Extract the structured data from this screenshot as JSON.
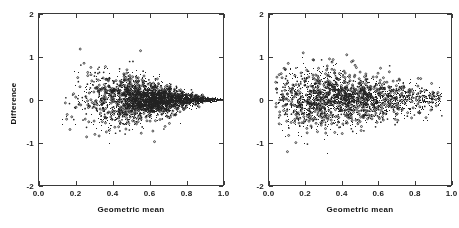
{
  "figure": {
    "panels": [
      {
        "id": "left-panel",
        "name": "left-scatter-panel",
        "xlabel": "Geometric mean",
        "ylabel": "Difference",
        "xticks": [
          "0.0",
          "0.2",
          "0.4",
          "0.6",
          "0.8",
          "1.0"
        ],
        "xtick_values": [
          0.0,
          0.2,
          0.4,
          0.6,
          0.8,
          1.0
        ],
        "yticks": [
          "2",
          "1",
          "0",
          "-1",
          "-2"
        ],
        "ytick_values": [
          2,
          1,
          0,
          -1,
          -2
        ]
      },
      {
        "id": "right-panel",
        "name": "right-scatter-panel",
        "xlabel": "Geometric mean",
        "ylabel": "",
        "xticks": [
          "0.0",
          "0.2",
          "0.4",
          "0.6",
          "0.8",
          "1.0"
        ],
        "xtick_values": [
          0.0,
          0.2,
          0.4,
          0.6,
          0.8,
          1.0
        ],
        "yticks": [
          "2",
          "1",
          "0",
          "-1",
          "-2"
        ],
        "ytick_values": [
          2,
          1,
          0,
          -1,
          -2
        ]
      }
    ]
  },
  "chart_data": [
    {
      "type": "scatter",
      "title": "",
      "xlabel": "Geometric mean",
      "ylabel": "Difference",
      "xlim": [
        0.0,
        1.0
      ],
      "ylim": [
        -2,
        2
      ],
      "xticks": [
        0.0,
        0.2,
        0.4,
        0.6,
        0.8,
        1.0
      ],
      "yticks": [
        -2,
        -1,
        0,
        1,
        2
      ],
      "grid": false,
      "legend": false,
      "marker": "open-circle",
      "marker_size_px": 2,
      "color": "#222222",
      "n_points": 2200,
      "description": "Funnel-shaped Bland-Altman plot: scatter centered on Difference = 0 with spread that shrinks steadily as Geometric mean increases from 0.0 to 1.0, converging to near zero at 1.0.",
      "spread_model": {
        "center": 0.0,
        "sd_at_x": [
          {
            "x": 0.05,
            "sd": 0.62
          },
          {
            "x": 0.1,
            "sd": 0.55
          },
          {
            "x": 0.2,
            "sd": 0.46
          },
          {
            "x": 0.3,
            "sd": 0.38
          },
          {
            "x": 0.4,
            "sd": 0.31
          },
          {
            "x": 0.5,
            "sd": 0.26
          },
          {
            "x": 0.6,
            "sd": 0.21
          },
          {
            "x": 0.7,
            "sd": 0.16
          },
          {
            "x": 0.8,
            "sd": 0.11
          },
          {
            "x": 0.9,
            "sd": 0.06
          },
          {
            "x": 1.0,
            "sd": 0.02
          }
        ],
        "x_density_peak": 0.62
      },
      "extremes": {
        "min_y": -1.8,
        "max_y": 1.5
      }
    },
    {
      "type": "scatter",
      "title": "",
      "xlabel": "Geometric mean",
      "ylabel": "",
      "xlim": [
        0.0,
        1.0
      ],
      "ylim": [
        -2,
        2
      ],
      "xticks": [
        0.0,
        0.2,
        0.4,
        0.6,
        0.8,
        1.0
      ],
      "yticks": [
        -2,
        -1,
        0,
        1,
        2
      ],
      "grid": false,
      "legend": false,
      "marker": "open-circle",
      "marker_size_px": 2,
      "color": "#222222",
      "n_points": 1700,
      "description": "Bland-Altman plot with an approximately uniform horizontal band centered slightly above Difference = 0, spread only mildly narrowing toward Geometric mean = 1.0; denser cloud between 0.1 and 0.5.",
      "spread_model": {
        "center": 0.02,
        "sd_at_x": [
          {
            "x": 0.05,
            "sd": 0.42
          },
          {
            "x": 0.1,
            "sd": 0.4
          },
          {
            "x": 0.2,
            "sd": 0.38
          },
          {
            "x": 0.3,
            "sd": 0.35
          },
          {
            "x": 0.4,
            "sd": 0.33
          },
          {
            "x": 0.5,
            "sd": 0.3
          },
          {
            "x": 0.6,
            "sd": 0.28
          },
          {
            "x": 0.7,
            "sd": 0.25
          },
          {
            "x": 0.8,
            "sd": 0.23
          },
          {
            "x": 0.9,
            "sd": 0.2
          },
          {
            "x": 1.0,
            "sd": 0.17
          }
        ],
        "x_density_peak": 0.33
      },
      "extremes": {
        "min_y": -1.85,
        "max_y": 1.78
      }
    }
  ],
  "style": {
    "background": "#ffffff",
    "axis_color": "#3a3a3a",
    "text_color": "#111111",
    "point_color": "#222222"
  }
}
